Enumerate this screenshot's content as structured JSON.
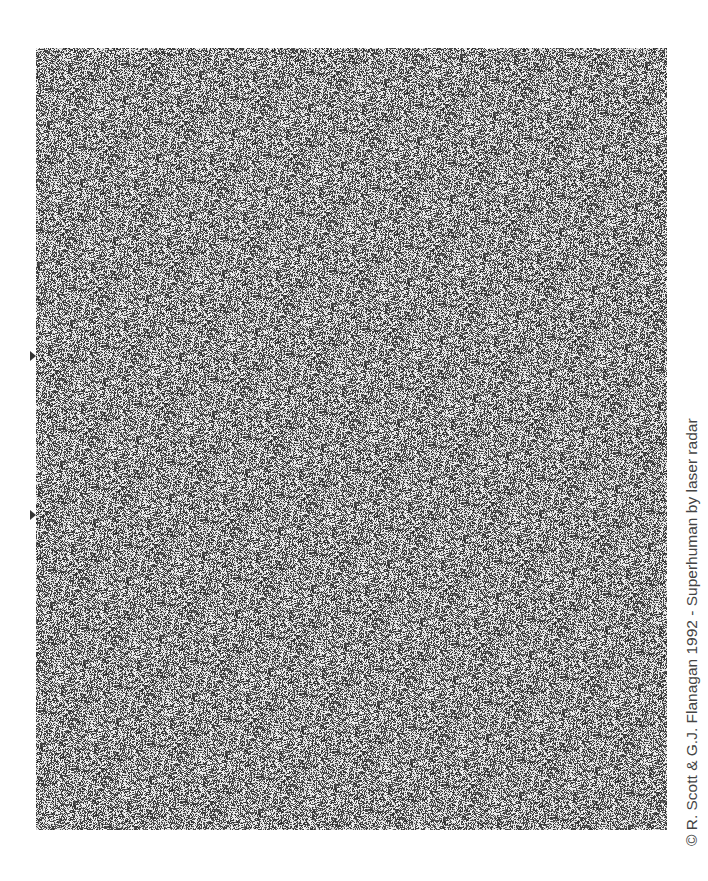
{
  "image": {
    "type": "random-dot autostereogram",
    "alignment_markers": 2
  },
  "credit": "© R. Scott & G.J. Flanagan 1992 - Superhuman by laser radar",
  "colors": {
    "background": "#ffffff",
    "dot_dark": "#2a2a2a",
    "dot_light": "#f2f2f2",
    "text": "#444444"
  }
}
